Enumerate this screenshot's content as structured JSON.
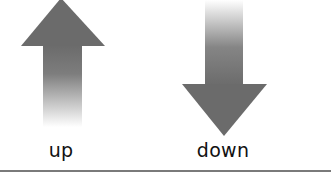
{
  "diagram": {
    "arrows": [
      {
        "direction": "up",
        "label": "up",
        "color": "#6b6b6b"
      },
      {
        "direction": "down",
        "label": "down",
        "color": "#6b6b6b"
      }
    ],
    "baseline_color": "#7a7a7a"
  }
}
